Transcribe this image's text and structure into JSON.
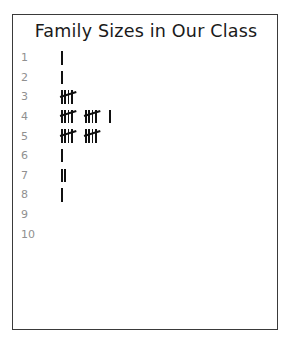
{
  "worksheet": {
    "title": "Family Sizes in Our Class",
    "border_color": "#3a3a3a",
    "background_color": "#ffffff",
    "label_color": "#909090",
    "mark_color": "#111111"
  },
  "chart_data": {
    "type": "table",
    "title": "Family Sizes in Our Class",
    "xlabel": "",
    "ylabel": "",
    "categories": [
      "1",
      "2",
      "3",
      "4",
      "5",
      "6",
      "7",
      "8",
      "9",
      "10"
    ],
    "values": [
      1,
      1,
      5,
      11,
      10,
      1,
      2,
      1,
      0,
      0
    ],
    "notation": "tally-marks",
    "group_size": 5,
    "grid": false,
    "legend": "none"
  },
  "rows": [
    {
      "label": "1",
      "count": 1
    },
    {
      "label": "2",
      "count": 1
    },
    {
      "label": "3",
      "count": 5
    },
    {
      "label": "4",
      "count": 11
    },
    {
      "label": "5",
      "count": 10
    },
    {
      "label": "6",
      "count": 1
    },
    {
      "label": "7",
      "count": 2
    },
    {
      "label": "8",
      "count": 1
    },
    {
      "label": "9",
      "count": 0
    },
    {
      "label": "10",
      "count": 0
    }
  ]
}
